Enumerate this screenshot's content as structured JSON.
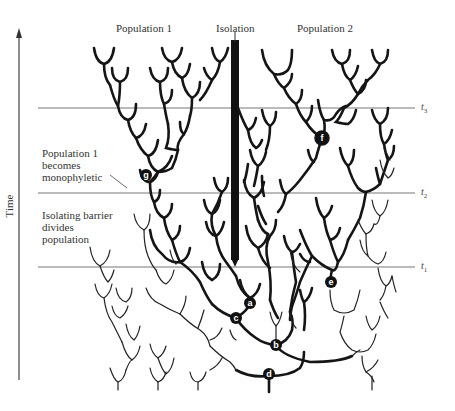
{
  "figure": {
    "labels": {
      "population1": "Population 1",
      "isolation": "Isolation",
      "population2": "Population 2",
      "monophyletic": [
        "Population 1",
        "becomes",
        "monophyletic"
      ],
      "barrier": [
        "Isolating barrier",
        "divides",
        "population"
      ],
      "time_axis": "Time"
    },
    "time_markers": [
      {
        "id": "t3",
        "base": "t",
        "sub": "3",
        "y": 108
      },
      {
        "id": "t2",
        "base": "t",
        "sub": "2",
        "y": 193
      },
      {
        "id": "t1",
        "base": "t",
        "sub": "1",
        "y": 267
      }
    ],
    "nodes": [
      {
        "id": "a",
        "x": 250,
        "y": 303
      },
      {
        "id": "b",
        "x": 276,
        "y": 345
      },
      {
        "id": "c",
        "x": 236,
        "y": 318
      },
      {
        "id": "d",
        "x": 269,
        "y": 374
      },
      {
        "id": "e",
        "x": 331,
        "y": 282
      },
      {
        "id": "f",
        "x": 322,
        "y": 138
      },
      {
        "id": "g",
        "x": 146,
        "y": 175
      }
    ],
    "colors": {
      "lineage": "#151515",
      "extinct_lineage": "#222222",
      "time_line": "#777777",
      "background": "#ffffff"
    }
  }
}
